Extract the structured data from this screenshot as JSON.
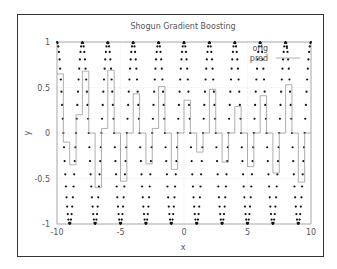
{
  "chart_data": {
    "type": "line",
    "title": "Shogun Gradient Boosting",
    "xlabel": "x",
    "ylabel": "y",
    "xlim": [
      -10,
      10
    ],
    "ylim": [
      -1,
      1
    ],
    "xticks": [
      "-10",
      "-5",
      "0",
      "5",
      "10"
    ],
    "yticks": [
      "1",
      "0.5",
      "0",
      "-0.5",
      "-1"
    ],
    "grid": true,
    "legend": {
      "position": "top-right",
      "entries": [
        "orig",
        "pred"
      ]
    },
    "series": [
      {
        "name": "orig",
        "style": "dots",
        "function": "cos(pi*x)",
        "x_range": [
          -10,
          10
        ],
        "period": 2
      },
      {
        "name": "pred",
        "style": "step-line",
        "x": [
          -10,
          -9.5,
          -9,
          -8.5,
          -8,
          -7.5,
          -7,
          -6.5,
          -6,
          -5.5,
          -5,
          -4.5,
          -4,
          -3.5,
          -3,
          -2.5,
          -2,
          -1.5,
          -1,
          -0.5,
          0,
          0.5,
          1,
          1.5,
          2,
          2.5,
          3,
          3.5,
          4,
          4.5,
          5,
          5.5,
          6,
          6.5,
          7,
          7.5,
          8,
          8.5,
          9,
          9.5
        ],
        "values": [
          0.65,
          -0.1,
          -0.35,
          0.2,
          0.68,
          0.0,
          -0.6,
          0.05,
          0.69,
          0.0,
          -0.53,
          0.0,
          0.43,
          0.0,
          -0.34,
          0.05,
          0.51,
          0.0,
          -0.4,
          0.0,
          0.36,
          0.0,
          -0.21,
          0.0,
          0.48,
          0.0,
          -0.32,
          0.0,
          0.29,
          0.0,
          -0.37,
          0.0,
          0.41,
          0.0,
          -0.44,
          0.0,
          0.53,
          0.0,
          -0.54,
          0.0
        ]
      }
    ]
  }
}
